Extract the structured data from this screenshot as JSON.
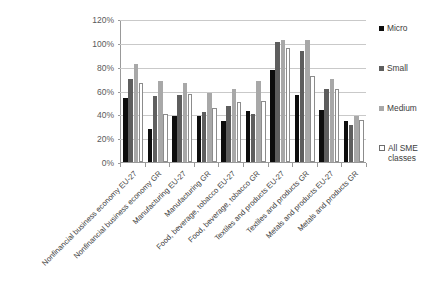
{
  "chart_data": {
    "type": "bar",
    "title": "",
    "subtitle": "",
    "xlabel": "",
    "ylabel": "",
    "ylim": [
      0,
      120
    ],
    "ytick_values": [
      0,
      20,
      40,
      60,
      80,
      100,
      120
    ],
    "ytick_labels": [
      "0%",
      "20%",
      "40%",
      "60%",
      "80%",
      "100%",
      "120%"
    ],
    "grid": true,
    "legend_position": "right",
    "categories": [
      "Nonfinancial business economy EU-27",
      "Nonfinancial business economy GR",
      "Manufacturing EU-27",
      "Manufacturing GR",
      "Food, beverage, tobacco EU-27",
      "Food, beverage, tobacco GR",
      "Textiles and products EU-27",
      "Textiles and products GR",
      "Metals and products EU-27",
      "Metals and products GR"
    ],
    "series": [
      {
        "name": "Micro",
        "color": "#0d0d0d",
        "values": [
          54,
          28,
          39,
          39,
          34,
          43,
          77,
          56,
          44,
          34
        ]
      },
      {
        "name": "Small",
        "color": "#5e5e5e",
        "values": [
          70,
          55,
          56,
          42,
          47,
          40,
          101,
          93,
          61,
          31
        ]
      },
      {
        "name": "Medium",
        "color": "#a8a8a8",
        "values": [
          82,
          68,
          66,
          58,
          61,
          68,
          102,
          102,
          70,
          39
        ]
      },
      {
        "name": "All SME classes",
        "color": "#ffffff",
        "values": [
          66,
          40,
          57,
          45,
          50,
          51,
          96,
          72,
          61,
          35
        ]
      }
    ]
  },
  "legend": {
    "items": [
      {
        "label": "Micro",
        "swatch": "black-square-icon"
      },
      {
        "label": "Small",
        "swatch": "dark-gray-square-icon"
      },
      {
        "label": "Medium",
        "swatch": "light-gray-square-icon"
      },
      {
        "label": "All SME\nclasses",
        "swatch": "white-square-icon"
      }
    ]
  }
}
